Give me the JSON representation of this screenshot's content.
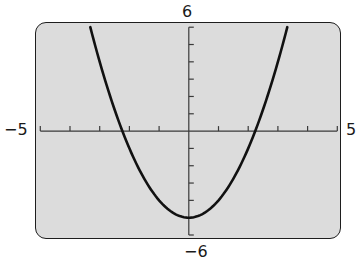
{
  "chart_data": {
    "type": "line",
    "title": "",
    "xlabel": "",
    "ylabel": "",
    "function": "y = x^2 - 5",
    "window": {
      "xmin": -5,
      "xmax": 5,
      "ymin": -6,
      "ymax": 6,
      "xscl": 1,
      "yscl": 1
    },
    "xlim": [
      -5,
      5
    ],
    "ylim": [
      -6,
      6
    ],
    "grid": false,
    "series": [
      {
        "name": "y = x^2 - 5",
        "x": [
          -3.32,
          -3,
          -2.5,
          -2.24,
          -2,
          -1.5,
          -1,
          -0.5,
          0,
          0.5,
          1,
          1.5,
          2,
          2.24,
          2.5,
          3,
          3.32
        ],
        "y": [
          6.0,
          4.0,
          1.25,
          0.0,
          -1.0,
          -2.75,
          -4.0,
          -4.75,
          -5.0,
          -4.75,
          -4.0,
          -2.75,
          -1.0,
          0.0,
          1.25,
          4.0,
          6.0
        ]
      }
    ],
    "key_points": {
      "vertex": [
        0,
        -5
      ],
      "x_intercepts": [
        -2.24,
        2.24
      ],
      "y_intercept": [
        0,
        -5
      ]
    },
    "axis_labels": {
      "top": "6",
      "bottom": "−6",
      "left": "−5",
      "right": "5"
    },
    "colors": {
      "screen_background": "#dcdcdc",
      "curve": "#111111",
      "axes": "#3a3a3a",
      "border": "#1e1e1e"
    }
  }
}
